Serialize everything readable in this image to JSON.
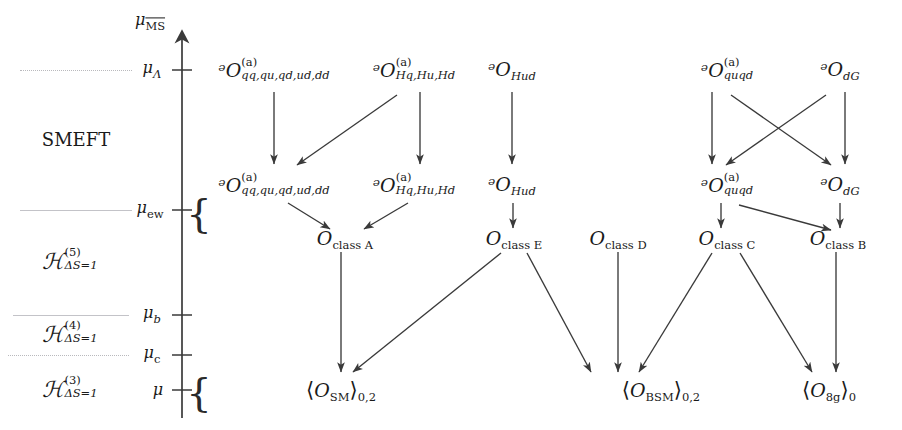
{
  "figure": {
    "kind": "rge-running-flow-diagram",
    "axis": {
      "name": "renormalization-scale-axis",
      "top_label_main": "μ",
      "top_label_sub": "MS",
      "ticks": [
        {
          "id": "mu_lambda",
          "base": "μ",
          "sub": "Λ",
          "y": 70
        },
        {
          "id": "mu_ew",
          "base": "μ",
          "sub": "ew",
          "y": 210
        },
        {
          "id": "mu_b",
          "base": "μ",
          "sub": "b",
          "y": 315
        },
        {
          "id": "mu_c",
          "base": "μ",
          "sub": "c",
          "y": 355
        },
        {
          "id": "mu",
          "base": "μ",
          "sub": "",
          "y": 390
        }
      ]
    },
    "regions": [
      {
        "id": "smeft",
        "label": "SMEFT",
        "kind": "plain",
        "y": 140
      },
      {
        "id": "h5",
        "label": "ℋ",
        "sup": "(5)",
        "sub": "ΔS=1",
        "y": 262
      },
      {
        "id": "h4",
        "label": "ℋ",
        "sup": "(4)",
        "sub": "ΔS=1",
        "y": 335
      },
      {
        "id": "h3",
        "label": "ℋ",
        "sup": "(3)",
        "sub": "ΔS=1",
        "y": 390
      }
    ],
    "braces": [
      {
        "id": "brace-ew",
        "y": 213,
        "x": 197,
        "height": 56
      },
      {
        "id": "brace-mu",
        "y": 392,
        "x": 197,
        "height": 56
      }
    ],
    "nodes": [
      {
        "id": "n1",
        "row": "above-ew",
        "x": 274,
        "y": 71,
        "sym": "ᵊO",
        "sup": "(a)",
        "sub": "qq,qu,qd,ud,dd",
        "stacked": true
      },
      {
        "id": "n2",
        "row": "above-ew",
        "x": 414,
        "y": 71,
        "sym": "ᵊO",
        "sup": "(a)",
        "sub": "Hq,Hu,Hd",
        "stacked": true
      },
      {
        "id": "n3",
        "row": "above-ew",
        "x": 512,
        "y": 71,
        "sym": "ᵊO",
        "sup": "",
        "sub": "Hud",
        "stacked": false
      },
      {
        "id": "n4",
        "row": "above-ew",
        "x": 727,
        "y": 71,
        "sym": "ᵊO",
        "sup": "(a)",
        "sub": "quqd",
        "stacked": true
      },
      {
        "id": "n5",
        "row": "above-ew",
        "x": 838,
        "y": 71,
        "sym": "ᵊO",
        "sup": "",
        "sub": "dG",
        "stacked": false
      },
      {
        "id": "m1",
        "row": "at-ew",
        "x": 274,
        "y": 186,
        "sym": "ᵊO",
        "sup": "(a)",
        "sub": "qq,qu,qd,ud,dd",
        "stacked": true
      },
      {
        "id": "m2",
        "row": "at-ew",
        "x": 414,
        "y": 186,
        "sym": "ᵊO",
        "sup": "(a)",
        "sub": "Hq,Hu,Hd",
        "stacked": true
      },
      {
        "id": "m3",
        "row": "at-ew",
        "x": 512,
        "y": 186,
        "sym": "ᵊO",
        "sup": "",
        "sub": "Hud",
        "stacked": false
      },
      {
        "id": "m4",
        "row": "at-ew",
        "x": 727,
        "y": 186,
        "sym": "ᵊO",
        "sup": "(a)",
        "sub": "quqd",
        "stacked": true
      },
      {
        "id": "m5",
        "row": "at-ew",
        "x": 838,
        "y": 186,
        "sym": "ᵊO",
        "sup": "",
        "sub": "dG",
        "stacked": false
      },
      {
        "id": "c_A",
        "row": "below-ew",
        "x": 345,
        "y": 240,
        "sym": "O",
        "sub": "class A"
      },
      {
        "id": "c_E",
        "row": "below-ew",
        "x": 514,
        "y": 240,
        "sym": "O",
        "sub": "class E"
      },
      {
        "id": "c_D",
        "row": "below-ew",
        "x": 618,
        "y": 240,
        "sym": "O",
        "sub": "class D"
      },
      {
        "id": "c_C",
        "row": "below-ew",
        "x": 727,
        "y": 240,
        "sym": "O",
        "sub": "class C"
      },
      {
        "id": "c_B",
        "row": "below-ew",
        "x": 838,
        "y": 240,
        "sym": "O",
        "sub": "class B"
      },
      {
        "id": "me_sm",
        "row": "bottom",
        "x": 341,
        "y": 391,
        "bra": "⟨",
        "sym": "O",
        "sub": "SM",
        "ket": "⟩",
        "post": "0,2"
      },
      {
        "id": "me_bsm",
        "row": "bottom",
        "x": 661,
        "y": 391,
        "bra": "⟨",
        "sym": "O",
        "sub": "BSM",
        "ket": "⟩",
        "post": "0,2"
      },
      {
        "id": "me_8g",
        "row": "bottom",
        "x": 829,
        "y": 391,
        "bra": "⟨",
        "sym": "O",
        "sub": "8g",
        "ket": "⟩",
        "post": "0"
      }
    ],
    "arrows": [
      {
        "id": "a1",
        "from": "n1",
        "to": "m1",
        "x1": 274,
        "y1": 90,
        "x2": 274,
        "y2": 166
      },
      {
        "id": "a2",
        "from": "n2",
        "to": "m1",
        "x1": 397,
        "y1": 92,
        "x2": 296,
        "y2": 166
      },
      {
        "id": "a3",
        "from": "n2",
        "to": "m2",
        "x1": 420,
        "y1": 90,
        "x2": 420,
        "y2": 166
      },
      {
        "id": "a4",
        "from": "n3",
        "to": "m3",
        "x1": 512,
        "y1": 90,
        "x2": 512,
        "y2": 166
      },
      {
        "id": "a5",
        "from": "n4",
        "to": "m4",
        "x1": 713,
        "y1": 90,
        "x2": 713,
        "y2": 166
      },
      {
        "id": "a6",
        "from": "n4",
        "to": "m5",
        "x1": 730,
        "y1": 92,
        "x2": 830,
        "y2": 166
      },
      {
        "id": "a7",
        "from": "n5",
        "to": "m4",
        "x1": 827,
        "y1": 92,
        "x2": 726,
        "y2": 166
      },
      {
        "id": "a8",
        "from": "n5",
        "to": "m5",
        "x1": 843,
        "y1": 90,
        "x2": 843,
        "y2": 166
      },
      {
        "id": "a9",
        "from": "m1",
        "to": "c_A",
        "x1": 288,
        "y1": 201,
        "x2": 332,
        "y2": 230
      },
      {
        "id": "a10",
        "from": "m2",
        "to": "c_A",
        "x1": 408,
        "y1": 201,
        "x2": 362,
        "y2": 230
      },
      {
        "id": "a11",
        "from": "m3",
        "to": "c_E",
        "x1": 513,
        "y1": 201,
        "x2": 513,
        "y2": 230
      },
      {
        "id": "a12",
        "from": "m4",
        "to": "c_C",
        "x1": 722,
        "y1": 201,
        "x2": 722,
        "y2": 230
      },
      {
        "id": "a13",
        "from": "m4",
        "to": "c_B",
        "x1": 740,
        "y1": 203,
        "x2": 832,
        "y2": 229
      },
      {
        "id": "a14",
        "from": "m5",
        "to": "c_B",
        "x1": 840,
        "y1": 201,
        "x2": 840,
        "y2": 230
      },
      {
        "id": "a15",
        "from": "c_A",
        "to": "me_sm",
        "x1": 341,
        "y1": 251,
        "x2": 341,
        "y2": 374
      },
      {
        "id": "a16",
        "from": "c_E",
        "to": "me_sm",
        "x1": 500,
        "y1": 252,
        "x2": 352,
        "y2": 373
      },
      {
        "id": "a17",
        "from": "c_E",
        "to": "me_bsm",
        "x1": 527,
        "y1": 252,
        "x2": 590,
        "y2": 374
      },
      {
        "id": "a18",
        "from": "c_D",
        "to": "me_bsm",
        "x1": 618,
        "y1": 251,
        "x2": 618,
        "y2": 374
      },
      {
        "id": "a19",
        "from": "c_C",
        "to": "me_bsm",
        "x1": 713,
        "y1": 252,
        "x2": 638,
        "y2": 374
      },
      {
        "id": "a20",
        "from": "c_C",
        "to": "me_8g",
        "x1": 740,
        "y1": 252,
        "x2": 813,
        "y2": 374
      },
      {
        "id": "a21",
        "from": "c_B",
        "to": "me_8g",
        "x1": 836,
        "y1": 251,
        "x2": 836,
        "y2": 374
      }
    ],
    "guide_lines": [
      {
        "id": "gl_lambda",
        "x": 20,
        "width": 112,
        "y": 70
      },
      {
        "id": "gl_ew",
        "x": 20,
        "width": 112,
        "y": 210
      },
      {
        "id": "gl_b",
        "x": 13,
        "width": 115,
        "y": 315
      },
      {
        "id": "gl_c",
        "x": 8,
        "width": 120,
        "y": 355
      }
    ],
    "colors": {
      "ink": "#1a1a1a",
      "arrow": "#3a3a3a",
      "axis": "#3a3a3a",
      "guide": "#b9b9bd",
      "background": "#ffffff"
    }
  }
}
